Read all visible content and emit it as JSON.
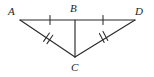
{
  "figure": {
    "kind": "geometry-diagram",
    "background_color": "#ffffff",
    "stroke_color": "#2b2b2b",
    "label_color": "#1d1d1d",
    "canvas": {
      "width": 154,
      "height": 77
    },
    "points": {
      "A": {
        "label": "A",
        "x": 20,
        "y": 20
      },
      "B": {
        "label": "B",
        "x": 75,
        "y": 20
      },
      "C": {
        "label": "C",
        "x": 75,
        "y": 57
      },
      "D": {
        "label": "D",
        "x": 135,
        "y": 20
      }
    },
    "segments": [
      {
        "name": "AB",
        "from": "A",
        "to": "B",
        "tick_marks": 1
      },
      {
        "name": "BD",
        "from": "B",
        "to": "D",
        "tick_marks": 1
      },
      {
        "name": "BC",
        "from": "B",
        "to": "C",
        "tick_marks": 0
      },
      {
        "name": "AC",
        "from": "A",
        "to": "C",
        "tick_marks": 2
      },
      {
        "name": "CD",
        "from": "C",
        "to": "D",
        "tick_marks": 2
      }
    ],
    "congruence_marks": {
      "single_tick_segments": [
        "AB",
        "BD"
      ],
      "double_tick_segments": [
        "AC",
        "CD"
      ]
    }
  }
}
